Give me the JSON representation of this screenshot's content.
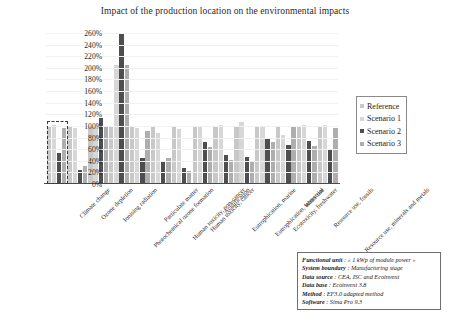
{
  "chart_data": {
    "type": "bar",
    "title": "Impact of the production location on the environmental impacts",
    "xlabel": "",
    "ylabel": "",
    "ylim": [
      0,
      260
    ],
    "ytick_labels": [
      "260%",
      "240%",
      "220%",
      "200%",
      "180%",
      "160%",
      "140%",
      "120%",
      "100%",
      "80%",
      "60%",
      "40%",
      "20%",
      "0%"
    ],
    "ytick_values": [
      260,
      240,
      220,
      200,
      180,
      160,
      140,
      120,
      100,
      80,
      60,
      40,
      20,
      0
    ],
    "grid": false,
    "legend_position": "right",
    "categories": [
      "Climate change",
      "Ozone depletion",
      "Ionising radiation",
      "Photochemical ozone formation",
      "Particulate matter",
      "Human toxicity, non-cancer",
      "Human toxicity, cancer",
      "Acidification",
      "Eutrophication, marine",
      "Eutrophication, terrestrial",
      "Ecotoxicity, freshwater",
      "Water use",
      "Resource use, fossils",
      "Resource use, minerals and metals"
    ],
    "series": [
      {
        "name": "Reference",
        "color": "#c8c8c8",
        "values": [
          100,
          100,
          100,
          100,
          100,
          100,
          100,
          100,
          100,
          100,
          100,
          100,
          100,
          100
        ]
      },
      {
        "name": "Scenario 1",
        "color": "#d7d7d7",
        "values": [
          101,
          96,
          100,
          205,
          97,
          88,
          94,
          99,
          101,
          106,
          99,
          84,
          102,
          101
        ]
      },
      {
        "name": "Scenario 2",
        "color": "#4e4e4e",
        "values": [
          53,
          24,
          114,
          258,
          44,
          40,
          28,
          72,
          50,
          47,
          80,
          67,
          74,
          61
        ]
      },
      {
        "name": "Scenario 3",
        "color": "#aeaeae",
        "values": [
          97,
          31,
          99,
          205,
          91,
          44,
          23,
          63,
          41,
          38,
          72,
          98,
          66,
          96
        ]
      }
    ],
    "highlight": {
      "category": "Climate change",
      "style": "dashed-box"
    }
  },
  "legend": {
    "items": [
      {
        "label": "Reference"
      },
      {
        "label": "Scenario 1"
      },
      {
        "label": "Scenario 2"
      },
      {
        "label": "Scenario 3"
      }
    ]
  },
  "footnote": {
    "rows": [
      {
        "key": "Functional unit",
        "sep": " : ",
        "value": "« 1 kWp of module power »"
      },
      {
        "key": "System boundary",
        "sep": " : ",
        "value": "Manufacturing stage"
      },
      {
        "key": "Data source",
        "sep": " : ",
        "value": "CEA, ISC and Ecoinvent"
      },
      {
        "key": "Data base",
        "sep": " : ",
        "value": "Ecoinvent 3.8"
      },
      {
        "key": "Method",
        "sep": " : ",
        "value": "EF3.0 adapted method"
      },
      {
        "key": "Software",
        "sep": " : ",
        "value": "Sima Pro 9.3"
      }
    ]
  }
}
